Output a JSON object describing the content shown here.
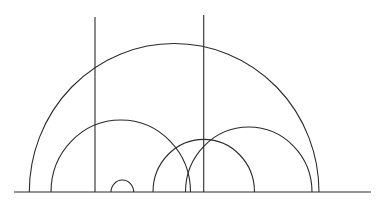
{
  "diagram": {
    "title": "",
    "type": "upper-half-plane-geodesics",
    "style": {
      "background": "#ffffff",
      "stroke": "#2b2b2b",
      "stroke_width": 1.1
    },
    "baseline": {
      "x1": 14,
      "x2": 371,
      "y": 192
    },
    "vertical_lines": [
      {
        "id": "vertical-geodesic-1",
        "x": 95,
        "y_top": 17
      },
      {
        "id": "vertical-geodesic-2",
        "x": 203.7,
        "y_top": 15
      }
    ],
    "semicircles": [
      {
        "id": "arc-large",
        "left": 29.3,
        "right": 319,
        "top": 43.5
      },
      {
        "id": "arc-left-medium",
        "left": 51,
        "right": 190.5,
        "top": 120
      },
      {
        "id": "arc-center",
        "left": 153,
        "right": 254.5,
        "top": 139.3
      },
      {
        "id": "arc-right-medium",
        "left": 185.5,
        "right": 312,
        "top": 127
      },
      {
        "id": "arc-small",
        "left": 111,
        "right": 133.7,
        "top": 180
      }
    ]
  }
}
